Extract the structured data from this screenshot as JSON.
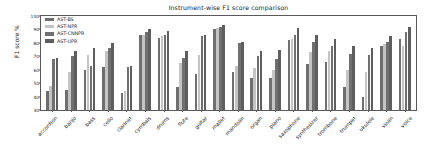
{
  "chart_data": {
    "type": "bar",
    "title": "Instrument-wise F1 score comparison",
    "xlabel": "",
    "ylabel": "F1 score %",
    "ylim": [
      30,
      100
    ],
    "yticks": [
      30,
      40,
      50,
      60,
      70,
      80,
      90,
      100
    ],
    "grid": false,
    "legend_position": "upper left",
    "categories": [
      "accordion",
      "banjo",
      "bass",
      "cello",
      "clarinet",
      "cymbals",
      "drums",
      "flute",
      "guitar",
      "mallet",
      "mandolin",
      "organ",
      "piano",
      "saxophone",
      "synthesizer",
      "trombone",
      "trumpet",
      "ukulele",
      "violin",
      "voice"
    ],
    "series": [
      {
        "name": "AST-BS",
        "color": "#6f6f6f",
        "values": [
          44,
          45,
          60,
          62,
          43,
          86,
          84,
          47,
          57,
          90,
          58,
          54,
          54,
          82,
          64,
          66,
          47,
          40,
          78,
          83
        ]
      },
      {
        "name": "AST-NPR",
        "color": "#c4c4c4",
        "values": [
          48,
          58,
          71,
          74,
          44,
          86,
          85,
          65,
          71,
          91,
          63,
          61,
          60,
          83,
          73,
          74,
          60,
          58,
          79,
          78
        ]
      },
      {
        "name": "AST-CNNPR",
        "color": "#707070",
        "values": [
          68,
          70,
          63,
          76,
          62,
          88,
          86,
          69,
          85,
          92,
          80,
          70,
          68,
          86,
          81,
          78,
          72,
          71,
          81,
          88
        ]
      },
      {
        "name": "AST-UPR",
        "color": "#5e5e5e",
        "values": [
          69,
          74,
          76,
          80,
          63,
          90,
          89,
          74,
          86,
          93,
          81,
          74,
          75,
          91,
          86,
          83,
          78,
          76,
          85,
          92
        ]
      }
    ]
  },
  "legend": {
    "items": [
      {
        "label": "AST-BS"
      },
      {
        "label": "AST-NPR"
      },
      {
        "label": "AST-CNNPR"
      },
      {
        "label": "AST-UPR"
      }
    ]
  }
}
